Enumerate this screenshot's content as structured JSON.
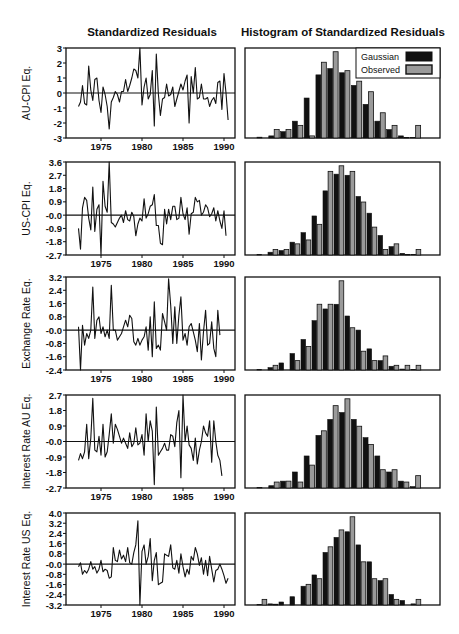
{
  "titles": {
    "left": "Standardized Residuals",
    "right": "Histogram of Standardized Residuals"
  },
  "legend": {
    "gaussian": "Gaussian",
    "observed": "Observed",
    "gaussian_color": "#111111",
    "observed_color": "#9a9a9a"
  },
  "x_ticks": [
    "1975",
    "1980",
    "1985",
    "1990"
  ],
  "chart_data": [
    {
      "type": "line",
      "title": "Standardized Residuals",
      "ylabel": "AU-CPI Eq.",
      "ylim": [
        -3,
        3
      ],
      "yticks": [
        "3",
        "2",
        "1",
        "0",
        "-1",
        "-2",
        "-3"
      ],
      "xticks": [
        "1975",
        "1980",
        "1985",
        "1990"
      ],
      "x_start": 1972.25,
      "x_step": 0.25,
      "values": [
        -0.9,
        -0.6,
        0.5,
        -0.7,
        -0.8,
        1.8,
        0.2,
        -0.5,
        0.9,
        1.0,
        -0.5,
        -1.3,
        0.4,
        -0.1,
        -0.9,
        -2.4,
        -0.6,
        -0.3,
        0.1,
        -0.1,
        -0.6,
        0.1,
        0.1,
        0.9,
        0.1,
        0.5,
        1.0,
        1.6,
        1.5,
        1.0,
        3.0,
        -0.8,
        0.4,
        1.0,
        -0.4,
        -0.1,
        1.5,
        -2.2,
        2.6,
        -0.1,
        -1.5,
        -0.4,
        -0.3,
        0.6,
        -0.2,
        -0.1,
        0.4,
        -0.9,
        -0.4,
        0.1,
        0.6,
        0.2,
        0.8,
        1.2,
        -2.0,
        1.1,
        0.0,
        1.7,
        -0.4,
        -0.3,
        0.6,
        -0.4,
        -0.4,
        -0.3,
        -0.9,
        -0.5,
        -0.3,
        -0.7,
        0.7,
        0.8,
        -1.1,
        1.3,
        0.0,
        -1.8
      ]
    },
    {
      "type": "line",
      "title": "Standardized Residuals",
      "ylabel": "US-CPI Eq.",
      "ylim": [
        -2.7,
        3.6
      ],
      "yticks": [
        "3.6",
        "2.7",
        "1.8",
        "0.9",
        "-0.0",
        "-0.9",
        "-1.8",
        "-2.7"
      ],
      "xticks": [
        "1975",
        "1980",
        "1985",
        "1990"
      ],
      "x_start": 1972.25,
      "x_step": 0.25,
      "values": [
        -0.9,
        -2.3,
        0.5,
        1.2,
        1.0,
        -0.2,
        -1.0,
        1.9,
        -1.1,
        0.4,
        0.7,
        -2.7,
        2.3,
        0.6,
        0.2,
        3.6,
        -0.5,
        -0.6,
        -0.8,
        -0.5,
        -0.2,
        0.0,
        -0.5,
        0.3,
        -0.3,
        -0.4,
        0.2,
        -0.1,
        -1.4,
        -0.6,
        -0.2,
        -0.4,
        1.1,
        -0.2,
        0.1,
        0.6,
        0.7,
        1.4,
        -0.7,
        -0.7,
        -1.9,
        -2.0,
        0.4,
        -0.6,
        0.4,
        -0.3,
        0.6,
        0.6,
        -0.3,
        -0.2,
        1.2,
        0.1,
        -0.3,
        0.5,
        -1.3,
        0.1,
        0.2,
        1.2,
        0.9,
        1.0,
        0.0,
        0.2,
        0.7,
        0.5,
        -0.1,
        0.1,
        0.5,
        -0.4,
        0.3,
        -0.4,
        -0.9,
        0.3,
        -1.4
      ]
    },
    {
      "type": "line",
      "title": "Standardized Residuals",
      "ylabel": "Exchange Rate Eq.",
      "ylim": [
        -2.4,
        3.2
      ],
      "yticks": [
        "3.2",
        "2.4",
        "1.6",
        "0.8",
        "-0.0",
        "-0.8",
        "-1.6",
        "-2.4"
      ],
      "xticks": [
        "1975",
        "1980",
        "1985",
        "1990"
      ],
      "x_start": 1972.25,
      "x_step": 0.25,
      "values": [
        0.2,
        -2.4,
        0.3,
        -0.9,
        -0.2,
        -0.5,
        0.0,
        2.6,
        -0.5,
        0.6,
        0.8,
        -0.2,
        0.2,
        -0.4,
        0.0,
        -0.5,
        2.7,
        0.0,
        0.0,
        -0.6,
        -0.4,
        -0.2,
        0.2,
        0.6,
        0.2,
        0.9,
        0.7,
        -0.7,
        -0.9,
        -0.5,
        -0.9,
        -0.6,
        -0.4,
        0.2,
        -1.2,
        0.8,
        -1.6,
        1.7,
        -1.1,
        -0.9,
        -1.2,
        1.0,
        0.5,
        0.0,
        3.1,
        1.5,
        -0.8,
        1.4,
        -0.8,
        0.9,
        2.0,
        -0.6,
        -0.2,
        -0.9,
        0.2,
        0.4,
        -0.1,
        -0.6,
        -1.3,
        0.4,
        -1.8,
        -0.1,
        1.2,
        -0.9,
        -0.8,
        0.5,
        -1.1,
        -1.6,
        1.2,
        -0.3
      ]
    },
    {
      "type": "line",
      "title": "Standardized Residuals",
      "ylabel": "Interest Rate AU Eq.",
      "ylim": [
        -2.7,
        2.7
      ],
      "yticks": [
        "2.7",
        "1.8",
        "0.9",
        "-0.0",
        "-0.9",
        "-1.8",
        "-2.7"
      ],
      "xticks": [
        "1975",
        "1980",
        "1985",
        "1990"
      ],
      "x_start": 1972.25,
      "x_step": 0.25,
      "values": [
        -1.1,
        -0.7,
        -1.0,
        -0.6,
        1.0,
        -1.0,
        0.2,
        2.5,
        -0.5,
        -0.6,
        0.3,
        -0.8,
        1.0,
        -0.9,
        -0.6,
        0.4,
        1.6,
        -0.1,
        1.0,
        0.7,
        0.3,
        -0.1,
        0.2,
        -0.1,
        -0.4,
        0.5,
        -0.3,
        -0.1,
        0.8,
        -0.2,
        -0.1,
        0.4,
        -0.8,
        1.6,
        0.0,
        1.2,
        0.6,
        -2.5,
        2.0,
        -0.8,
        -0.6,
        -0.4,
        -0.1,
        -0.5,
        -0.5,
        0.4,
        0.3,
        -0.3,
        1.1,
        1.8,
        -2.1,
        2.7,
        0.0,
        0.9,
        -0.2,
        -0.4,
        -1.1,
        0.2,
        -1.3,
        -0.5,
        0.0,
        0.9,
        0.5,
        0.3,
        1.2,
        -1.2,
        1.2,
        0.0,
        -0.8,
        -1.1,
        -2.0
      ]
    },
    {
      "type": "line",
      "title": "Standardized Residuals",
      "ylabel": "Interest Rate US Eq.",
      "ylim": [
        -3.2,
        4.0
      ],
      "yticks": [
        "4.0",
        "3.2",
        "2.4",
        "1.6",
        "0.8",
        "-0.0",
        "-0.8",
        "-1.6",
        "-2.4",
        "-3.2"
      ],
      "xticks": [
        "1975",
        "1980",
        "1985",
        "1990"
      ],
      "x_start": 1972.25,
      "x_step": 0.25,
      "values": [
        -0.2,
        0.1,
        -0.8,
        -0.5,
        -0.7,
        -0.4,
        0.2,
        -0.4,
        -0.2,
        -0.7,
        -0.4,
        0.3,
        -0.6,
        -0.4,
        -0.5,
        -1.1,
        -1.0,
        1.3,
        0.3,
        0.2,
        1.1,
        0.4,
        0.7,
        0.2,
        1.3,
        0.1,
        0.0,
        0.9,
        1.5,
        3.4,
        -3.2,
        1.0,
        1.5,
        0.0,
        0.6,
        2.0,
        -1.3,
        0.3,
        0.9,
        -1.6,
        -1.5,
        -1.4,
        0.8,
        0.7,
        0.6,
        1.5,
        -0.3,
        -0.4,
        0.3,
        -0.7,
        0.8,
        -0.2,
        -1.0,
        -0.4,
        -0.8,
        0.6,
        0.3,
        1.3,
        0.8,
        -0.1,
        0.5,
        -0.8,
        0.3,
        -0.9,
        0.6,
        -0.4,
        -1.4,
        -0.5,
        -0.4,
        0.0,
        -0.4,
        -0.9,
        -1.5,
        -1.1
      ]
    },
    {
      "type": "bar",
      "title": "Histogram of Standardized Residuals",
      "panel": "AU-CPI Eq.",
      "legend": [
        "Gaussian",
        "Observed"
      ],
      "legend_position": "upper right",
      "series": [
        {
          "name": "Gaussian",
          "values": [
            0.2,
            0.5,
            1.5,
            4.0,
            9.5,
            15.0,
            16.5,
            15.5,
            12.5,
            8.0,
            4.0,
            2.0,
            0.5,
            0.1
          ]
        },
        {
          "name": "Observed",
          "values": [
            0.0,
            2.0,
            2.0,
            3.0,
            0.5,
            18.0,
            20.5,
            16.0,
            13.5,
            11.0,
            6.0,
            3.0,
            0.1,
            3.0
          ]
        }
      ]
    },
    {
      "type": "bar",
      "title": "Histogram of Standardized Residuals",
      "panel": "US-CPI Eq.",
      "series": [
        {
          "name": "Gaussian",
          "values": [
            0.1,
            0.5,
            0.8,
            2.3,
            4.0,
            7.0,
            11.5,
            14.5,
            14.3,
            10.5,
            7.5,
            3.5,
            1.5,
            0.3,
            0.1
          ]
        },
        {
          "name": "Observed",
          "values": [
            0.0,
            1.0,
            1.0,
            2.0,
            2.7,
            5.5,
            15.0,
            16.0,
            15.0,
            9.5,
            5.0,
            1.0,
            2.0,
            0.1,
            1.0
          ]
        }
      ]
    },
    {
      "type": "bar",
      "title": "Histogram of Standardized Residuals",
      "panel": "Exchange Rate Eq.",
      "series": [
        {
          "name": "Gaussian",
          "values": [
            0.1,
            0.5,
            1.5,
            3.5,
            6.5,
            10.5,
            13.0,
            14.0,
            11.5,
            8.5,
            4.5,
            2.0,
            0.8,
            0.2,
            0.1
          ]
        },
        {
          "name": "Observed",
          "values": [
            0.0,
            1.0,
            0.0,
            2.0,
            5.0,
            14.0,
            14.0,
            19.0,
            9.0,
            4.0,
            2.0,
            3.0,
            1.0,
            1.0,
            1.0
          ]
        }
      ]
    },
    {
      "type": "bar",
      "title": "Histogram of Standardized Residuals",
      "panel": "Interest Rate AU Eq.",
      "series": [
        {
          "name": "Gaussian",
          "values": [
            0.1,
            0.5,
            1.5,
            3.5,
            7.0,
            11.5,
            15.0,
            16.5,
            15.0,
            11.0,
            7.0,
            3.5,
            1.5,
            0.3
          ]
        },
        {
          "name": "Observed",
          "values": [
            0.0,
            1.3,
            1.5,
            1.3,
            5.0,
            12.5,
            18.0,
            19.5,
            13.5,
            9.5,
            4.0,
            4.0,
            1.3,
            2.7
          ]
        }
      ]
    },
    {
      "type": "bar",
      "title": "Histogram of Standardized Residuals",
      "panel": "Interest Rate US Eq.",
      "series": [
        {
          "name": "Gaussian",
          "values": [
            0.1,
            0.3,
            0.8,
            2.2,
            5.0,
            8.0,
            14.0,
            18.0,
            19.5,
            16.0,
            11.5,
            6.5,
            2.8,
            1.2,
            0.3
          ]
        },
        {
          "name": "Observed",
          "values": [
            1.5,
            0.2,
            0.0,
            0.0,
            5.5,
            7.0,
            15.5,
            20.0,
            23.5,
            11.5,
            7.0,
            7.0,
            1.5,
            0.0,
            1.5
          ]
        }
      ]
    }
  ]
}
